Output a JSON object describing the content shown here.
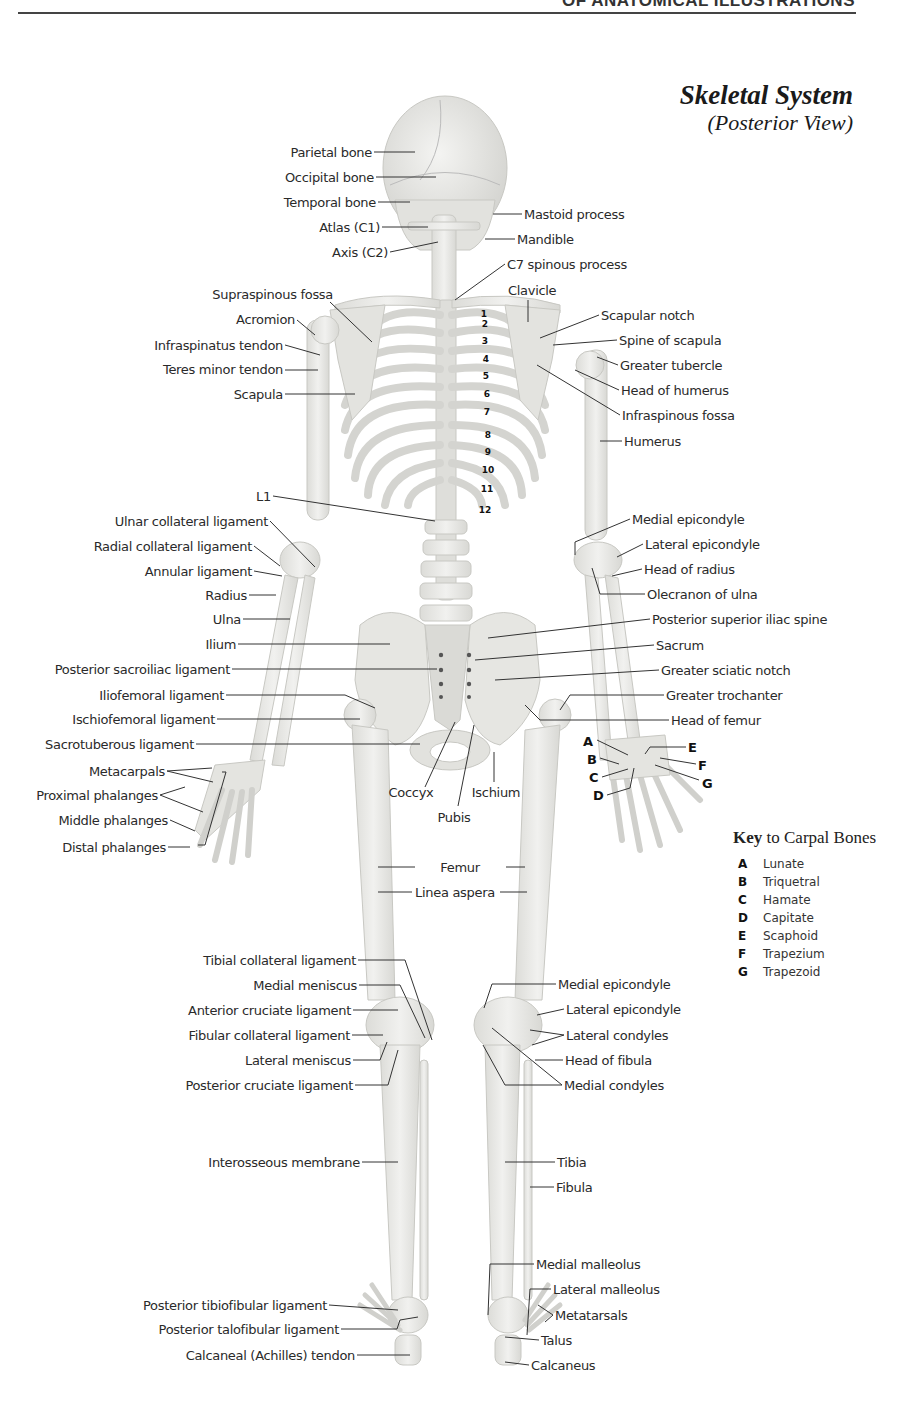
{
  "header": {
    "running_head": "OF ANATOMICAL ILLUSTRATIONS",
    "title": "Skeletal System",
    "subtitle": "(Posterior View)"
  },
  "labels": {
    "left": [
      {
        "id": "parietal-bone",
        "text": "Parietal bone",
        "x": 372,
        "y": 145
      },
      {
        "id": "occipital-bone",
        "text": "Occipital bone",
        "x": 374,
        "y": 170
      },
      {
        "id": "temporal-bone",
        "text": "Temporal bone",
        "x": 376,
        "y": 195
      },
      {
        "id": "atlas-c1",
        "text": "Atlas (C1)",
        "x": 380,
        "y": 220
      },
      {
        "id": "axis-c2",
        "text": "Axis (C2)",
        "x": 388,
        "y": 245
      },
      {
        "id": "supraspinous-fossa",
        "text": "Supraspinous fossa",
        "x": 333,
        "y": 287
      },
      {
        "id": "acromion",
        "text": "Acromion",
        "x": 295,
        "y": 312
      },
      {
        "id": "infraspinatus-tendon",
        "text": "Infraspinatus tendon",
        "x": 283,
        "y": 338
      },
      {
        "id": "teres-minor-tendon",
        "text": "Teres minor tendon",
        "x": 283,
        "y": 362
      },
      {
        "id": "scapula",
        "text": "Scapula",
        "x": 283,
        "y": 387
      },
      {
        "id": "l1",
        "text": "L1",
        "x": 271,
        "y": 489
      },
      {
        "id": "ulnar-collateral-ligament",
        "text": "Ulnar collateral ligament",
        "x": 268,
        "y": 514
      },
      {
        "id": "radial-collateral-ligament",
        "text": "Radial collateral ligament",
        "x": 252,
        "y": 539
      },
      {
        "id": "annular-ligament",
        "text": "Annular ligament",
        "x": 252,
        "y": 564
      },
      {
        "id": "radius",
        "text": "Radius",
        "x": 247,
        "y": 588
      },
      {
        "id": "ulna",
        "text": "Ulna",
        "x": 241,
        "y": 612
      },
      {
        "id": "ilium",
        "text": "Ilium",
        "x": 236,
        "y": 637
      },
      {
        "id": "posterior-sacroiliac-ligament",
        "text": "Posterior sacroiliac ligament",
        "x": 230,
        "y": 662
      },
      {
        "id": "iliofemoral-ligament",
        "text": "Iliofemoral ligament",
        "x": 224,
        "y": 688
      },
      {
        "id": "ischiofemoral-ligament",
        "text": "Ischiofemoral ligament",
        "x": 215,
        "y": 712
      },
      {
        "id": "sacrotuberous-ligament",
        "text": "Sacrotuberous ligament",
        "x": 194,
        "y": 737
      },
      {
        "id": "metacarpals",
        "text": "Metacarpals",
        "x": 165,
        "y": 764
      },
      {
        "id": "proximal-phalanges",
        "text": "Proximal phalanges",
        "x": 158,
        "y": 788
      },
      {
        "id": "middle-phalanges",
        "text": "Middle phalanges",
        "x": 168,
        "y": 813
      },
      {
        "id": "distal-phalanges",
        "text": "Distal phalanges",
        "x": 166,
        "y": 840
      },
      {
        "id": "tibial-collateral-ligament",
        "text": "Tibial collateral ligament",
        "x": 356,
        "y": 953
      },
      {
        "id": "medial-meniscus",
        "text": "Medial meniscus",
        "x": 357,
        "y": 978
      },
      {
        "id": "anterior-cruciate-ligament",
        "text": "Anterior cruciate ligament",
        "x": 351,
        "y": 1003
      },
      {
        "id": "fibular-collateral-ligament",
        "text": "Fibular collateral ligament",
        "x": 350,
        "y": 1028
      },
      {
        "id": "lateral-meniscus",
        "text": "Lateral meniscus",
        "x": 351,
        "y": 1053
      },
      {
        "id": "posterior-cruciate-ligament",
        "text": "Posterior cruciate ligament",
        "x": 353,
        "y": 1078
      },
      {
        "id": "interosseous-membrane",
        "text": "Interosseous membrane",
        "x": 360,
        "y": 1155
      },
      {
        "id": "posterior-tibiofibular-ligament",
        "text": "Posterior tibiofibular ligament",
        "x": 327,
        "y": 1298
      },
      {
        "id": "posterior-talofibular-ligament",
        "text": "Posterior talofibular ligament",
        "x": 339,
        "y": 1322
      },
      {
        "id": "calcaneal-achilles-tendon",
        "text": "Calcaneal (Achilles) tendon",
        "x": 355,
        "y": 1348
      }
    ],
    "right": [
      {
        "id": "mastoid-process",
        "text": "Mastoid process",
        "x": 524,
        "y": 207
      },
      {
        "id": "mandible",
        "text": "Mandible",
        "x": 517,
        "y": 232
      },
      {
        "id": "c7-spinous-process",
        "text": "C7 spinous process",
        "x": 507,
        "y": 257
      },
      {
        "id": "scapular-notch",
        "text": "Scapular notch",
        "x": 601,
        "y": 308
      },
      {
        "id": "spine-of-scapula",
        "text": "Spine of scapula",
        "x": 619,
        "y": 333
      },
      {
        "id": "greater-tubercle",
        "text": "Greater tubercle",
        "x": 620,
        "y": 358
      },
      {
        "id": "head-of-humerus",
        "text": "Head of humerus",
        "x": 621,
        "y": 383
      },
      {
        "id": "infraspinous-fossa",
        "text": "Infraspinous fossa",
        "x": 622,
        "y": 408
      },
      {
        "id": "humerus",
        "text": "Humerus",
        "x": 624,
        "y": 434
      },
      {
        "id": "medial-epicondyle-arm",
        "text": "Medial epicondyle",
        "x": 632,
        "y": 512
      },
      {
        "id": "lateral-epicondyle-arm",
        "text": "Lateral epicondyle",
        "x": 645,
        "y": 537
      },
      {
        "id": "head-of-radius",
        "text": "Head of radius",
        "x": 644,
        "y": 562
      },
      {
        "id": "olecranon-of-ulna",
        "text": "Olecranon of ulna",
        "x": 647,
        "y": 587
      },
      {
        "id": "posterior-superior-iliac-spine",
        "text": "Posterior superior iliac spine",
        "x": 652,
        "y": 612
      },
      {
        "id": "sacrum",
        "text": "Sacrum",
        "x": 656,
        "y": 638
      },
      {
        "id": "greater-sciatic-notch",
        "text": "Greater sciatic notch",
        "x": 661,
        "y": 663
      },
      {
        "id": "greater-trochanter",
        "text": "Greater trochanter",
        "x": 666,
        "y": 688
      },
      {
        "id": "head-of-femur",
        "text": "Head of femur",
        "x": 671,
        "y": 713
      },
      {
        "id": "medial-epicondyle-leg",
        "text": "Medial epicondyle",
        "x": 558,
        "y": 977
      },
      {
        "id": "lateral-epicondyle-leg",
        "text": "Lateral epicondyle",
        "x": 566,
        "y": 1002
      },
      {
        "id": "lateral-condyles",
        "text": "Lateral condyles",
        "x": 566,
        "y": 1028
      },
      {
        "id": "head-of-fibula",
        "text": "Head of fibula",
        "x": 565,
        "y": 1053
      },
      {
        "id": "medial-condyles",
        "text": "Medial condyles",
        "x": 564,
        "y": 1078
      },
      {
        "id": "tibia",
        "text": "Tibia",
        "x": 557,
        "y": 1155
      },
      {
        "id": "fibula",
        "text": "Fibula",
        "x": 556,
        "y": 1180
      },
      {
        "id": "medial-malleolus",
        "text": "Medial malleolus",
        "x": 536,
        "y": 1257
      },
      {
        "id": "lateral-malleolus",
        "text": "Lateral malleolus",
        "x": 553,
        "y": 1282
      },
      {
        "id": "metatarsals",
        "text": "Metatarsals",
        "x": 555,
        "y": 1308
      },
      {
        "id": "talus",
        "text": "Talus",
        "x": 541,
        "y": 1333
      },
      {
        "id": "calcaneus",
        "text": "Calcaneus",
        "x": 531,
        "y": 1358
      }
    ],
    "center": [
      {
        "id": "clavicle",
        "text": "Clavicle",
        "x": 530,
        "y": 283
      },
      {
        "id": "coccyx",
        "text": "Coccyx",
        "x": 411,
        "y": 785
      },
      {
        "id": "ischium",
        "text": "Ischium",
        "x": 496,
        "y": 785
      },
      {
        "id": "pubis",
        "text": "Pubis",
        "x": 454,
        "y": 810
      },
      {
        "id": "femur",
        "text": "Femur",
        "x": 460,
        "y": 860
      },
      {
        "id": "linea-aspera",
        "text": "Linea aspera",
        "x": 455,
        "y": 885
      }
    ]
  },
  "rib_numbers": [
    {
      "n": "1",
      "x": 484,
      "y": 309
    },
    {
      "n": "2",
      "x": 485,
      "y": 319
    },
    {
      "n": "3",
      "x": 485,
      "y": 336
    },
    {
      "n": "4",
      "x": 486,
      "y": 354
    },
    {
      "n": "5",
      "x": 486,
      "y": 371
    },
    {
      "n": "6",
      "x": 487,
      "y": 389
    },
    {
      "n": "7",
      "x": 487,
      "y": 407
    },
    {
      "n": "8",
      "x": 488,
      "y": 430
    },
    {
      "n": "9",
      "x": 488,
      "y": 447
    },
    {
      "n": "10",
      "x": 488,
      "y": 465
    },
    {
      "n": "11",
      "x": 487,
      "y": 484
    },
    {
      "n": "12",
      "x": 485,
      "y": 505
    }
  ],
  "carpal_letters": [
    {
      "letter": "A",
      "x": 583,
      "y": 734
    },
    {
      "letter": "B",
      "x": 587,
      "y": 752
    },
    {
      "letter": "C",
      "x": 589,
      "y": 770
    },
    {
      "letter": "D",
      "x": 593,
      "y": 788
    },
    {
      "letter": "E",
      "x": 688,
      "y": 740
    },
    {
      "letter": "F",
      "x": 698,
      "y": 758
    },
    {
      "letter": "G",
      "x": 702,
      "y": 776
    }
  ],
  "carpal_key": {
    "title_bold": "Key",
    "title_rest": " to Carpal Bones",
    "entries": [
      {
        "key": "A",
        "name": "Lunate"
      },
      {
        "key": "B",
        "name": "Triquetral"
      },
      {
        "key": "C",
        "name": "Hamate"
      },
      {
        "key": "D",
        "name": "Capitate"
      },
      {
        "key": "E",
        "name": "Scaphoid"
      },
      {
        "key": "F",
        "name": "Trapezium"
      },
      {
        "key": "G",
        "name": "Trapezoid"
      }
    ]
  },
  "colors": {
    "bone_fill": "#ececea",
    "bone_shade": "#d6d6d2",
    "bone_outline": "#c4c4bf",
    "leader_line": "#333333"
  }
}
